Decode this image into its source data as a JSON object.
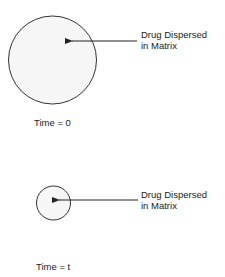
{
  "diagram": {
    "stages": [
      {
        "annotation_line1": "Drug Dispersed",
        "annotation_line2": "in Matrix",
        "time_label": "Time = 0",
        "circle_size": "large"
      },
      {
        "annotation_line1": "Drug Dispersed",
        "annotation_line2": "in Matrix",
        "time_label": "Time = t",
        "circle_size": "small"
      }
    ],
    "colors": {
      "stroke": "#333333",
      "fill": "#f6f6f6",
      "background": "#ffffff"
    }
  }
}
